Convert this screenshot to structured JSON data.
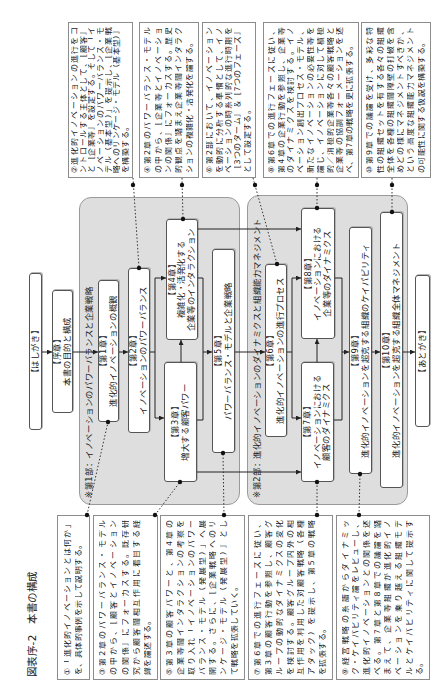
{
  "figure": {
    "title": "図表序-2　本書の構成"
  },
  "flow": {
    "preface": "【はしがき】",
    "intro": {
      "label": "【序章】",
      "title": [
        "本書の目的と構成"
      ]
    },
    "part1": {
      "label": "※第1部：イノベーションのパワーバランスと企業戦略",
      "chapters": [
        {
          "label": "【第1章】",
          "title": [
            "進化的イノベーションの概観"
          ]
        },
        {
          "label": "【第2章】",
          "title": [
            "イノベーションのパワーバランス"
          ]
        },
        {
          "label": "【第3章】",
          "title": [
            "増大する顧客パワー"
          ]
        },
        {
          "label": "【第4章】",
          "title": [
            "複雑化・活発化する",
            "企業等のインタラクション"
          ]
        },
        {
          "label": "【第5章】",
          "title": [
            "パワーバランス・モデルと企業戦略"
          ]
        }
      ]
    },
    "part2": {
      "label": "※第2部：進化的イノベーションのダイナミクスと組織能力マネジメント",
      "chapters": [
        {
          "label": "【第6章】",
          "title": [
            "進化的イノベーションの進行プロセス"
          ]
        },
        {
          "label": "【第7章】",
          "title": [
            "イノベーションにおける",
            "顧客のダイナミクス"
          ]
        },
        {
          "label": "【第8章】",
          "title": [
            "イノベーションにおける",
            "企業等のダイナミクス"
          ]
        },
        {
          "label": "【第9章】",
          "title": [
            "進化的イノベーションを超克する組織のケイパビリティ"
          ]
        },
        {
          "label": "【第10章】",
          "title": [
            "進化的イノベーションを超克する組織全体マネジメント"
          ]
        }
      ]
    },
    "afterword": "【あとがき】"
  },
  "notes": [
    {
      "id": "①",
      "attached_to": "第1章",
      "lines": [
        "①「進化的イノベーションとは何か」",
        "を、具体的事例を示して説明する。"
      ]
    },
    {
      "id": "②",
      "attached_to": "第2章",
      "lines": [
        "②進化的イノベーションの進行をコ",
        "ントロールする主体として、［顧客］",
        "と［企業等］を設定する。そして「イ",
        "ノベーションのパワーバランス・モ",
        "デル（基本型）」を提示し、［企業戦",
        "略へのリンケージ・モデル（基本型）］",
        "を構築する。"
      ]
    },
    {
      "id": "③",
      "attached_to": "第3章",
      "lines": [
        "③第2章のパワーバランス・モデル",
        "の中から、［顧客とイノベーション",
        "の関係］にフォーカスする。既存研",
        "究から顧客間相互作用に着目する経",
        "緯を論述する。"
      ]
    },
    {
      "id": "④",
      "attached_to": "第4章",
      "lines": [
        "④第2章のパワーバランス・モデル",
        "の中から、［企業等とイノベーショ",
        "ンの関係］にフォーカスする。歴史",
        "的観点を踏まえ企業等間インタラク",
        "ションの複雑化・活発化を論ずる。"
      ]
    },
    {
      "id": "⑤",
      "attached_to": "第5章",
      "lines": [
        "⑤第3章の顧客パワーと、第4章の",
        "企業等間インタラクションの考察を",
        "取り入れ「イノベーションのパワー",
        "バランス・モデル（発展型）」へ展",
        "開する。さらに、［企業戦略へのリ",
        "ンケージ・モデル（発展型）］とし",
        "て戦略を拡張していく。"
      ]
    },
    {
      "id": "⑥",
      "attached_to": "第6章",
      "lines": [
        "⑥第2部において、イノベーション",
        "を動的に分析する準備として、イノ",
        "ベーションの時系列的な進行時期を",
        "［3つのターム］＆［7つのフェーズ］",
        "として設定する。"
      ]
    },
    {
      "id": "⑦",
      "attached_to": "第7章",
      "lines": [
        "⑦第6章での進行フェーズに従い、",
        "第3章の顧客行動を参照し、顧客グ",
        "ループの動的なダイナミクスの変化",
        "を検討する。顧客グループ内外の相",
        "互作用を利用した対顧客戦略（各種",
        "アタック）を提示し、第5章の戦略",
        "を拡張する。"
      ]
    },
    {
      "id": "⑧",
      "attached_to": "第8章",
      "lines": [
        "⑧第6章での進行フェーズに従い、",
        "第4章の企業行動を参照し、企業等",
        "のダイナミクスを検討する。イノ",
        "ベーション創出プロセス・モデル、",
        "新たなイノベーションの必要性等を",
        "論じ、イノベーションに対して積極",
        "的／消極的企業等各々の顧客戦略と",
        "企業等の協調フォーメーションを述",
        "べ、第7章の戦略を更に拡張する。"
      ]
    },
    {
      "id": "⑨",
      "attached_to": "第9章",
      "lines": [
        "⑨経営戦略の系譜からダイナミッ",
        "ク・ケイパビリティ論をレビューし、",
        "進化的イノベーションとの関係を述",
        "べる。第7章と第8章での議論を踏",
        "まえて、企業等組織が進化的イノ",
        "ベーションを乗り越える組織モデ",
        "ルとケイパビリティに関して提示す",
        "る。"
      ]
    },
    {
      "id": "⑩",
      "attached_to": "第10章",
      "lines": [
        "⑩第9章での議論を受け、多彩な特",
        "性の組織セットを有する各々の組織",
        "全体を各種の組織間障壁の打破を含",
        "めどの様にマネジメントすべきか、",
        "という高度な組織能力マネジメント",
        "の可能性に関する仮説を構築する。"
      ]
    }
  ],
  "connections": [
    [
      "はしがき",
      "序章"
    ],
    [
      "序章",
      "第1章"
    ],
    [
      "第1章",
      "第2章"
    ],
    [
      "第2章",
      "第3章"
    ],
    [
      "第2章",
      "第4章"
    ],
    [
      "第3章",
      "第4章"
    ],
    [
      "第3章",
      "第5章"
    ],
    [
      "第4章",
      "第5章"
    ],
    [
      "第5章",
      "第6章"
    ],
    [
      "第3章",
      "第7章"
    ],
    [
      "第4章",
      "第8章"
    ],
    [
      "第6章",
      "第7章"
    ],
    [
      "第6章",
      "第8章"
    ],
    [
      "第7章",
      "第8章"
    ],
    [
      "第7章",
      "第9章"
    ],
    [
      "第8章",
      "第9章"
    ],
    [
      "第9章",
      "第10章"
    ],
    [
      "第10章",
      "あとがき"
    ]
  ],
  "colors": {
    "group_bg": "#dedede",
    "group_border": "#9a9a9a",
    "box_border": "#555555",
    "note_border": "#8c8c8c",
    "line": "#222222",
    "text": "#222222",
    "page_bg": "#ffffff"
  }
}
